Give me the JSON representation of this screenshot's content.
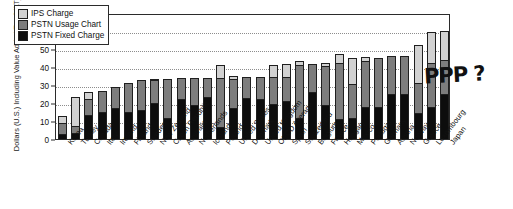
{
  "chart_data": {
    "type": "bar",
    "stacked": true,
    "title": "",
    "xlabel": "",
    "ylabel": "Dollars (U.S.) Including Value Added Tax (VAT)",
    "ylim": [
      0,
      70
    ],
    "yticks": [
      0,
      10,
      20,
      30,
      40,
      50,
      60,
      70
    ],
    "grid": true,
    "legend_position": "top-left",
    "categories": [
      "Korea",
      "Turkey",
      "Canada",
      "Italy",
      "Ireland",
      "Finland",
      "Sweden",
      "New Zealand",
      "Czech Republic",
      "Australia",
      "Netherlands",
      "Iceland",
      "Poland",
      "United States",
      "Denmark",
      "United Kingdom",
      "OECD Average",
      "Spain",
      "Switzerland",
      "Belgium",
      "France",
      "Hungary",
      "Mexico",
      "Portugal",
      "Germany",
      "Austria",
      "Norway",
      "Greece",
      "Luxembourg",
      "Japan"
    ],
    "series": [
      {
        "name": "PSTN Fixed Charge",
        "color": "#0d0d0d",
        "values": [
          3.0,
          3.5,
          13.5,
          15.0,
          17.5,
          15.0,
          16.0,
          20.0,
          11.5,
          22.0,
          19.0,
          23.5,
          6.5,
          17.5,
          23.0,
          22.5,
          19.5,
          21.0,
          11.5,
          26.0,
          19.0,
          11.0,
          11.5,
          18.0,
          18.0,
          25.0,
          25.0,
          14.5,
          18.0,
          25.0
        ]
      },
      {
        "name": "PSTN Usage Chart",
        "color": "#7d7d7d",
        "values": [
          6.0,
          3.5,
          9.0,
          11.5,
          11.5,
          16.0,
          17.0,
          13.0,
          22.0,
          12.0,
          15.0,
          10.5,
          27.5,
          16.0,
          11.5,
          12.0,
          15.0,
          13.5,
          29.5,
          15.5,
          21.5,
          31.0,
          19.0,
          25.5,
          27.0,
          21.0,
          21.0,
          16.5,
          24.0,
          19.0
        ]
      },
      {
        "name": "IPS Charge",
        "color": "#d2d2d2",
        "values": [
          4.0,
          16.5,
          3.5,
          0.0,
          0.0,
          0.0,
          0.0,
          0.5,
          0.0,
          0.0,
          0.0,
          0.0,
          7.0,
          1.5,
          0.0,
          0.0,
          6.5,
          7.0,
          2.5,
          0.0,
          1.5,
          5.0,
          14.5,
          2.0,
          0.0,
          0.0,
          0.0,
          21.0,
          17.5,
          16.0
        ]
      }
    ],
    "totals": [
      13.0,
      23.5,
      26.0,
      26.5,
      29.0,
      31.0,
      33.0,
      33.5,
      33.5,
      34.0,
      34.0,
      34.0,
      41.0,
      35.0,
      34.5,
      34.5,
      41.0,
      41.5,
      43.5,
      41.5,
      42.0,
      47.0,
      45.0,
      45.5,
      45.0,
      46.0,
      46.0,
      52.0,
      59.5,
      60.0
    ]
  },
  "legend": {
    "items": [
      {
        "label": "IPS Charge",
        "key": "ips"
      },
      {
        "label": "PSTN Usage Chart",
        "key": "usage"
      },
      {
        "label": "PSTN Fixed Charge",
        "key": "fixed"
      }
    ]
  },
  "annotation": {
    "text": "PPP ?"
  }
}
